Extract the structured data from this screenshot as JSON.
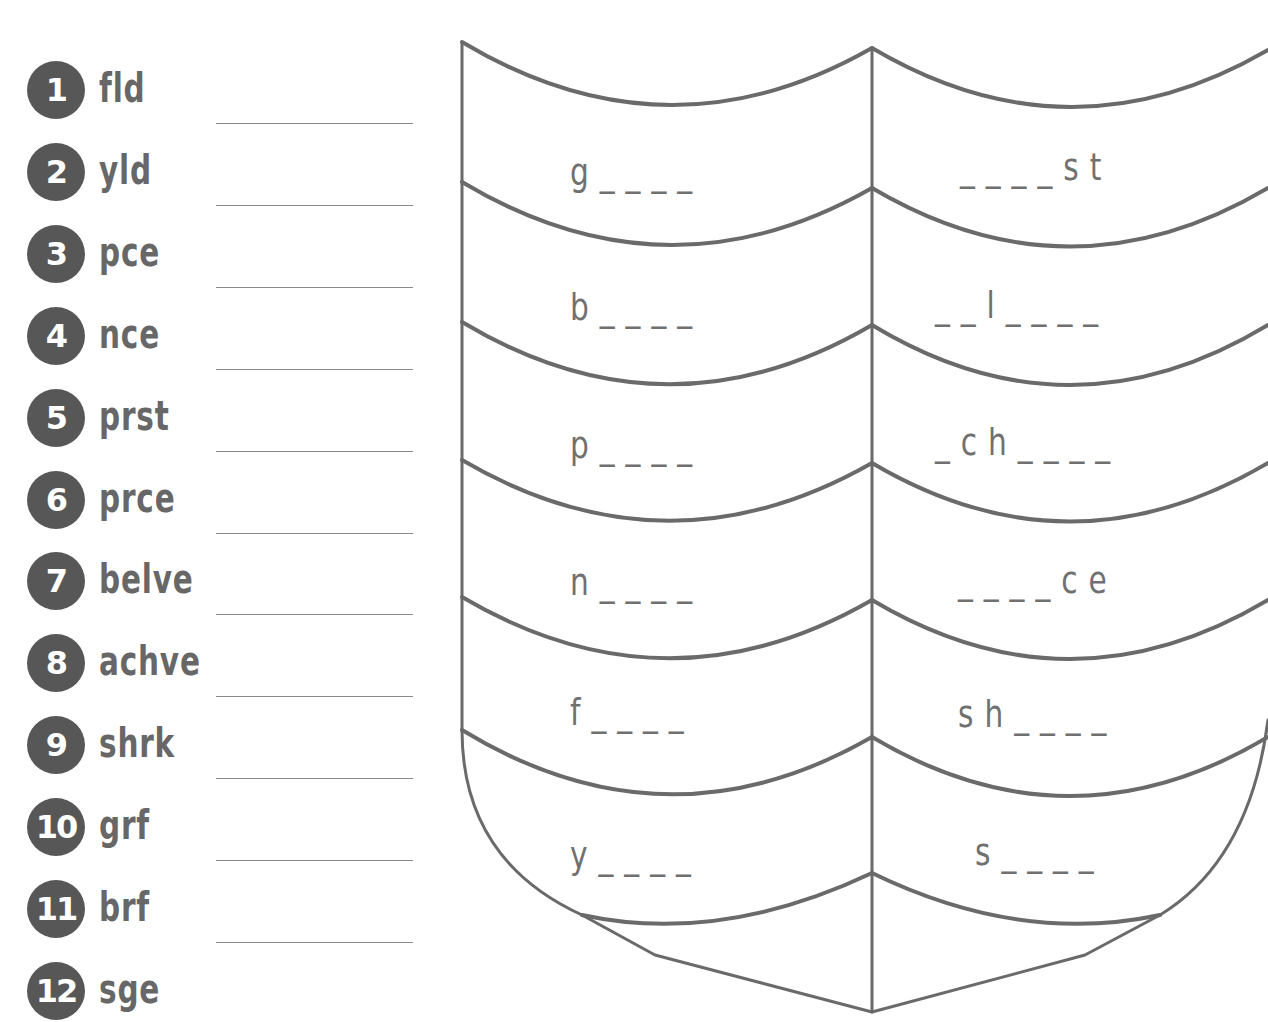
{
  "colors": {
    "circle": "#575757",
    "text": "#676767",
    "shield_stroke": "#6a6a6a",
    "answer_line": "#8a8a8a"
  },
  "word_list": {
    "items": [
      {
        "number": "1",
        "abbreviation": "fld"
      },
      {
        "number": "2",
        "abbreviation": "yld"
      },
      {
        "number": "3",
        "abbreviation": "pce"
      },
      {
        "number": "4",
        "abbreviation": "nce"
      },
      {
        "number": "5",
        "abbreviation": "prst"
      },
      {
        "number": "6",
        "abbreviation": "prce"
      },
      {
        "number": "7",
        "abbreviation": "belve"
      },
      {
        "number": "8",
        "abbreviation": "achve"
      },
      {
        "number": "9",
        "abbreviation": "shrk"
      },
      {
        "number": "10",
        "abbreviation": "grf"
      },
      {
        "number": "11",
        "abbreviation": "brf"
      },
      {
        "number": "12",
        "abbreviation": "sge"
      }
    ]
  },
  "shield": {
    "left_column": [
      {
        "pattern": "g _ _ _ _"
      },
      {
        "pattern": "b _ _ _ _"
      },
      {
        "pattern": "p _ _ _ _"
      },
      {
        "pattern": "n _ _ _ _"
      },
      {
        "pattern": "f _ _ _ _"
      },
      {
        "pattern": "y _ _ _ _"
      }
    ],
    "right_column": [
      {
        "pattern": "_ _ _ _ s t"
      },
      {
        "pattern": "_ _ l _ _ _ _"
      },
      {
        "pattern": "_ c h _ _ _ _"
      },
      {
        "pattern": "_ _ _ _ c e"
      },
      {
        "pattern": "s h _ _ _ _"
      },
      {
        "pattern": "s _ _ _ _"
      }
    ]
  }
}
